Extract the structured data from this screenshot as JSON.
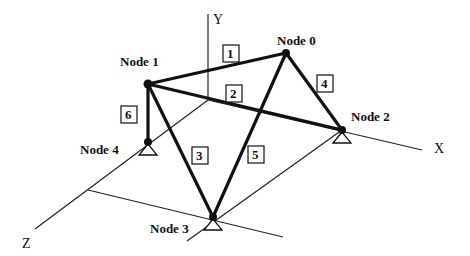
{
  "diagram": {
    "axes": {
      "x_label": "X",
      "y_label": "Y",
      "z_label": "Z"
    },
    "nodes": [
      {
        "id": 0,
        "label": "Node 0",
        "x": 286,
        "y": 53,
        "support": false
      },
      {
        "id": 1,
        "label": "Node 1",
        "x": 148,
        "y": 84,
        "support": false
      },
      {
        "id": 2,
        "label": "Node 2",
        "x": 342,
        "y": 130,
        "support": true
      },
      {
        "id": 3,
        "label": "Node 3",
        "x": 213,
        "y": 217,
        "support": true
      },
      {
        "id": 4,
        "label": "Node 4",
        "x": 148,
        "y": 142,
        "support": true
      }
    ],
    "members": [
      {
        "id": "1",
        "label": "1",
        "from": 1,
        "to": 0
      },
      {
        "id": "2",
        "label": "2",
        "from": 1,
        "to": 2
      },
      {
        "id": "3",
        "label": "3",
        "from": 1,
        "to": 3
      },
      {
        "id": "4",
        "label": "4",
        "from": 0,
        "to": 2
      },
      {
        "id": "5",
        "label": "5",
        "from": 0,
        "to": 3
      },
      {
        "id": "6",
        "label": "6",
        "from": 1,
        "to": 4
      }
    ],
    "colors": {
      "ink": "#111111",
      "background": "#ffffff"
    }
  }
}
